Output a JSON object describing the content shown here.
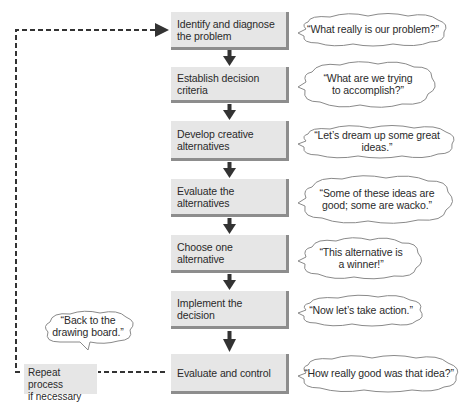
{
  "diagram": {
    "type": "decision-making process flowchart",
    "colors": {
      "box_fill": "#e6e6e6",
      "box_shadow": "#8d8d8d",
      "arrow": "#333333",
      "cloud_stroke": "#8a8a8a",
      "dashed_line": "#333333"
    },
    "steps": [
      {
        "label": "Identify and diagnose the problem",
        "thought": "“What really is our problem?”"
      },
      {
        "label": "Establish decision criteria",
        "thought": "“What are we trying\nto accomplish?”"
      },
      {
        "label": "Develop creative alternatives",
        "thought": "“Let’s dream up some great ideas.”"
      },
      {
        "label": "Evaluate the alternatives",
        "thought": "“Some of these ideas are\ngood; some are wacko.”"
      },
      {
        "label": "Choose one alternative",
        "thought": "“This alternative is\na winner!”"
      },
      {
        "label": "Implement the decision",
        "thought": "“Now let’s take action.”"
      },
      {
        "label": "Evaluate and control",
        "thought": "“How really good was that idea?”"
      }
    ],
    "feedback_loop": {
      "label": "Repeat process\nif necessary",
      "thought": "“Back to the\ndrawing board.”"
    }
  }
}
